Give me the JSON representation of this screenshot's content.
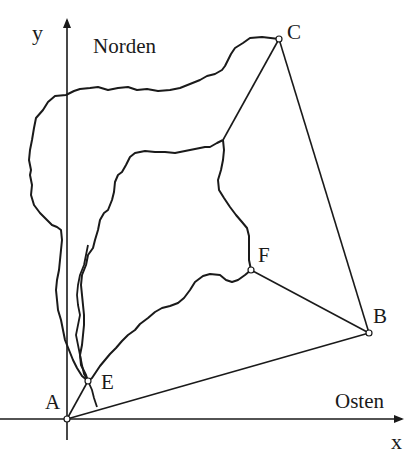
{
  "diagram": {
    "axes": {
      "x_label": "x",
      "y_label": "y",
      "east_label": "Osten",
      "north_label": "Norden"
    },
    "points": {
      "A": {
        "label": "A",
        "x": 67,
        "y": 419
      },
      "B": {
        "label": "B",
        "x": 369,
        "y": 333
      },
      "C": {
        "label": "C",
        "x": 279,
        "y": 39
      },
      "E": {
        "label": "E",
        "x": 88,
        "y": 381
      },
      "F": {
        "label": "F",
        "x": 251,
        "y": 270
      }
    },
    "segments": [
      "A-B",
      "B-C",
      "B-F",
      "A-E",
      "C-junction"
    ],
    "colors": {
      "stroke": "#1a1a1a",
      "background": "#ffffff"
    }
  }
}
